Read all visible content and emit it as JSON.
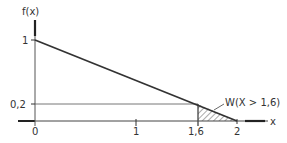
{
  "diagram": {
    "y_axis_label": "f(x)",
    "x_axis_label": "x",
    "y_ticks": [
      {
        "label": "1",
        "value": 1
      },
      {
        "label": "0,2",
        "value": 0.2
      }
    ],
    "x_ticks": [
      {
        "label": "0",
        "value": 0
      },
      {
        "label": "1",
        "value": 1
      },
      {
        "label": "1,6",
        "value": 1.6
      },
      {
        "label": "2",
        "value": 2
      }
    ],
    "shaded_region_label": "W(X > 1,6)",
    "function": "f(x) = 1 - 0.5x, 0 ≤ x ≤ 2",
    "line_color": "#333333",
    "hatch_color": "#555555"
  }
}
